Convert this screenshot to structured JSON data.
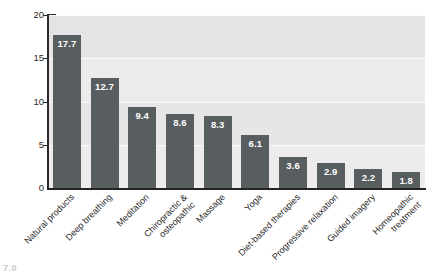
{
  "chart_data": {
    "type": "bar",
    "title": "",
    "xlabel": "",
    "ylabel": "Percentage",
    "ylim": [
      0,
      20
    ],
    "yticks": [
      0,
      5,
      10,
      15,
      20
    ],
    "ytick_labels": [
      "0",
      "5",
      "10",
      "15",
      "20"
    ],
    "grid": true,
    "legend": false,
    "bar_color": "#585d60",
    "plot_background": "#e9e9e9",
    "gridline_color": "#fbfbfb",
    "value_label_color": "#ffffff",
    "categories": [
      "Natural products",
      "Deep breathing",
      "Meditation",
      "Chiropractic & osteopathic",
      "Massage",
      "Yoga",
      "Diet-based therapies",
      "Progressive relaxation",
      "Guided imagery",
      "Homeopathic treatment"
    ],
    "category_lines": [
      [
        "Natural products"
      ],
      [
        "Deep breathing"
      ],
      [
        "Meditation"
      ],
      [
        "Chiropractic &",
        "osteopathic"
      ],
      [
        "Massage"
      ],
      [
        "Yoga"
      ],
      [
        "Diet-based therapies"
      ],
      [
        "Progressive relaxation"
      ],
      [
        "Guided imagery"
      ],
      [
        "Homeopathic",
        "treatment"
      ]
    ],
    "values": [
      17.7,
      12.7,
      9.4,
      8.6,
      8.3,
      6.1,
      3.6,
      2.9,
      2.2,
      1.8
    ],
    "value_labels": [
      "17.7",
      "12.7",
      "9.4",
      "8.6",
      "8.3",
      "6.1",
      "3.6",
      "2.9",
      "2.2",
      "1.8"
    ]
  },
  "artifact": {
    "bottom_left_text": "7.0"
  }
}
